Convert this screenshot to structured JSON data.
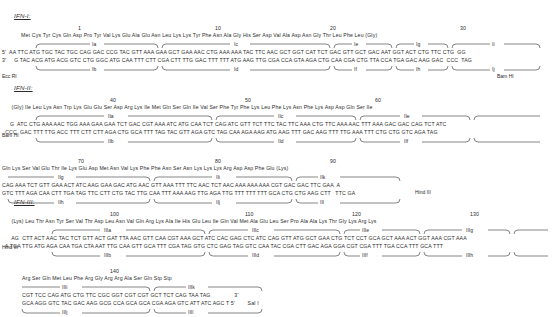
{
  "figure": {
    "title_hidden": "",
    "type": "synthetic-gene-sequence-diagram"
  },
  "sections": [
    {
      "label": "IFN-I:",
      "lines": [
        {
          "numbers": [
            {
              "value": "1",
              "x": 78
            },
            {
              "value": "10",
              "x": 215
            },
            {
              "value": "20",
              "x": 330
            },
            {
              "value": "30",
              "x": 460
            }
          ],
          "aa": "            Met Cys Tyr Cys Gln Asp Pro Tyr Val Lys Glu Ala Glu Asn Leu Lys Lys Tyr Phe Asn Ala Gly His Ser Asp Val Ala Asp Asn Gly Thr Leu Phe Leu (Gly)",
          "top_bands": [
            {
              "label": "Ia",
              "x1": 36,
              "x2": 158
            },
            {
              "label": "Ic",
              "x1": 162,
              "x2": 330
            },
            {
              "label": "Ie",
              "x1": 334,
              "x2": 392
            },
            {
              "label": "Ig",
              "x1": 396,
              "x2": 448
            },
            {
              "label": "Ii",
              "x1": 452,
              "x2": 540
            }
          ],
          "strand5": "5'  AA TTC ATG TGC TAC TGC CAG GAC CCG TAC GTT AAA GAA GCT GAA AAC CTG AAA AAA TAC TTC AAC GCT GGT CAT TCT GAC GTT GCT GAC AAT GGT ACT CTG TTC CTG  GG",
          "strand3": "3'     G TAC ACG ATG ACG GTC CTG GGC ATG CAA TTT CTT CGA CTT TTG GAC TTT TTT ATG AAG TTG CGA CCA GTA AGA CTG CAA CGA CTG TTA CCA TGA GAC AAG GAC  CCC  TAG",
          "bottom_bands": [
            {
              "label": "Ib",
              "x1": 36,
              "x2": 158
            },
            {
              "label": "Id",
              "x1": 162,
              "x2": 330
            },
            {
              "label": "If",
              "x1": 334,
              "x2": 392
            },
            {
              "label": "Ih",
              "x1": 396,
              "x2": 448
            },
            {
              "label": "Ij",
              "x1": 452,
              "x2": 540
            }
          ],
          "enzyme_left": "Ecc RI",
          "enzyme_right": "Bam HI"
        }
      ]
    },
    {
      "label": "IFN-II:",
      "lines": [
        {
          "numbers": [
            {
              "value": "40",
              "x": 110
            },
            {
              "value": "50",
              "x": 245
            },
            {
              "value": "60",
              "x": 375
            }
          ],
          "aa": "      (Gly) Ile Leu Lys Asn Trp Lys Glu Glu Ser Asp Arg Lys Ile Met Gln Ser Gln Ile Val Ser Phe Tyr Phe Lys Leu Phe Lys Asn Phe Lys Asp Asp Gln Ser Ile",
          "top_bands": [
            {
              "label": "IIa",
              "x1": 36,
              "x2": 212
            },
            {
              "label": "IIc",
              "x1": 216,
              "x2": 356
            },
            {
              "label": "IIe",
              "x1": 360,
              "x2": 470
            },
            {
              "label": "",
              "x1": 474,
              "x2": 540
            }
          ],
          "strand5": "     G  ATC CTG AAA AAC TGG AAA GAA GAA TCT GAC CGT AAA ATC ATG CAA TCT CAG ATC GTT TCT TTC TAC TTC AAA CTG TTC AAA AAC TTT AAA GAC GAC CAG TCT ATC",
          "strand3": "  CCC  GAC TTT TTG ACC TTT CTT CTT AGA CTG GCA TTT TAG TAC GTT AGA GTC TAG CAA AGA AAG ATG AAG TTT GAC AAG TTT TTG AAA TTT CTG CTG GTC AGA TAG",
          "bottom_bands": [
            {
              "label": "IIb",
              "x1": 36,
              "x2": 212
            },
            {
              "label": "IId",
              "x1": 216,
              "x2": 356
            },
            {
              "label": "IIf",
              "x1": 360,
              "x2": 470
            },
            {
              "label": "",
              "x1": 474,
              "x2": 540
            }
          ],
          "enzyme_left": "Bam HI",
          "enzyme_right": ""
        },
        {
          "numbers": [
            {
              "value": "70",
              "x": 78
            },
            {
              "value": "80",
              "x": 215
            },
            {
              "value": "90",
              "x": 330
            }
          ],
          "aa": "Gln Lys Ser Val Glu Thr Ile Lys Glu Asp Met Asn Val Lys Phe Phe Asn Ser Asn Lys Lys Lys Arg Asp Asp Phe Glu (Lys)",
          "top_bands": [
            {
              "label": "IIg",
              "x1": 8,
              "x2": 150
            },
            {
              "label": "IIi",
              "x1": 154,
              "x2": 292
            },
            {
              "label": "IIk",
              "x1": 296,
              "x2": 400
            }
          ],
          "strand5": "CAG AAA TCT GTT GAA ACT ATC AAG GAA GAC ATG AAC GTT AAA TTT TTC AAC TCT AAC AAA AAA AAA CGT GAC GAC TTC GAA  A",
          "strand3": "GTC TTT AGA CAA CTT TGA TAG TTC CTT CTG TAC TTG CAA TTT AAA AAG TTG AGA TTG TTT TTT TTT GCA CTG CTG AAG CTT   TTC GA",
          "bottom_bands": [
            {
              "label": "IIh",
              "x1": 8,
              "x2": 150
            },
            {
              "label": "IIj",
              "x1": 154,
              "x2": 292
            },
            {
              "label": "IIl",
              "x1": 296,
              "x2": 400
            }
          ],
          "enzyme_left": "",
          "enzyme_right": "Hind III"
        }
      ]
    },
    {
      "label": "IFN-III:",
      "lines": [
        {
          "numbers": [
            {
              "value": "100",
              "x": 110
            },
            {
              "value": "110",
              "x": 245
            },
            {
              "value": "120",
              "x": 352
            },
            {
              "value": "130",
              "x": 470
            }
          ],
          "aa": "      (Lys) Leu Thr Asn Tyr Ser Val Thr Asp Leu Asn Val Gln Arg Lys Ala Ile His Glu Leu Ile Gln Val Met Ala Glu Leu Ser Pro Ala Ala Lys Thr Gly Lys Arg Lys",
          "top_bands": [
            {
              "label": "IIIa",
              "x1": 52,
              "x2": 205
            },
            {
              "label": "IIIc",
              "x1": 209,
              "x2": 340
            },
            {
              "label": "IIIe",
              "x1": 344,
              "x2": 420
            },
            {
              "label": "IIIg",
              "x1": 424,
              "x2": 510
            },
            {
              "label": "",
              "x1": 514,
              "x2": 548
            }
          ],
          "strand5": "      AG  CTT ACT AAC TAC TCT GTT ACT GAT TTA AAC GTT CAA CGT AAA GCT ATC CAC GAG CTC ATC CAG GTT ATG GCT GAA CTG TCT CCT GCA GCT AAA ACT GGT AAA CGT AAA",
          "strand3": "  A TGA TTG ATG AGA CAA TGA CTA AAT TTG CAA GTT GCA TTT CGA TAG GTG CTC GAG TAG GTC CAA TAC CGA CTT GAC AGA GGA CGT CGA TTT TGA CCA TTT GCA TTT",
          "bottom_bands": [
            {
              "label": "IIIb",
              "x1": 52,
              "x2": 205
            },
            {
              "label": "IIId",
              "x1": 209,
              "x2": 340
            },
            {
              "label": "IIIf",
              "x1": 344,
              "x2": 420
            },
            {
              "label": "IIIh",
              "x1": 424,
              "x2": 510
            },
            {
              "label": "",
              "x1": 514,
              "x2": 548
            }
          ],
          "enzyme_left": "Hind III",
          "enzyme_right": ""
        },
        {
          "numbers": [
            {
              "value": "140",
              "x": 110
            }
          ],
          "aa": "Arg Ser Gln Met Leu Phe Arg Gly Arg Arg Ala Ser Gln Stp Stp",
          "top_bands": [
            {
              "label": "IIIi",
              "x1": 22,
              "x2": 150
            },
            {
              "label": "IIIk",
              "x1": 154,
              "x2": 262
            }
          ],
          "strand5": "CGT TCC CAG ATG CTG TTC CGC GGT CGT CGT GCT TCT CAG TAA TAG               3'",
          "strand3": "GCA AGG GTC TAC GAC AAG GCG CCA GCA GCA CGA AGA GTC ATT ATC AGC T 5'        Sal I",
          "bottom_bands": [
            {
              "label": "IIIj",
              "x1": 22,
              "x2": 150
            },
            {
              "label": "IIIl",
              "x1": 154,
              "x2": 262
            }
          ],
          "enzyme_left": "",
          "enzyme_right": "Sal I"
        }
      ]
    }
  ]
}
